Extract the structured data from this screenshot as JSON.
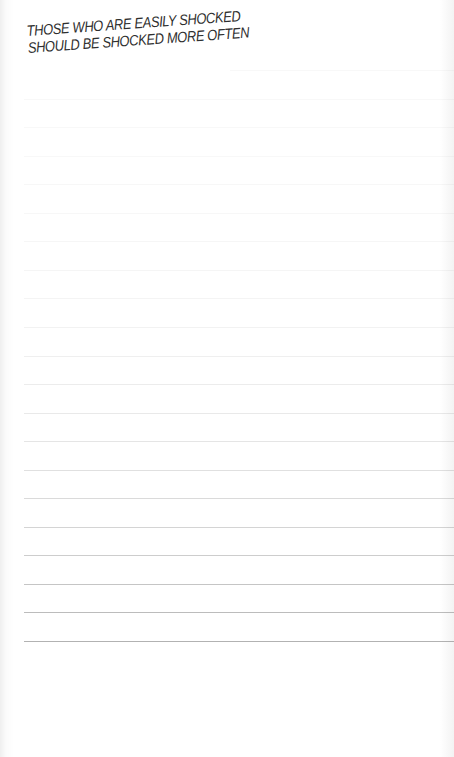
{
  "heading": {
    "line1": "THOSE WHO ARE EASILY SHOCKED",
    "line2": "SHOULD BE SHOCKED MORE OFTEN"
  },
  "ruled_lines": {
    "count": 21,
    "first_y": 70,
    "spacing": 28.55,
    "color": "#8a8a8a"
  }
}
